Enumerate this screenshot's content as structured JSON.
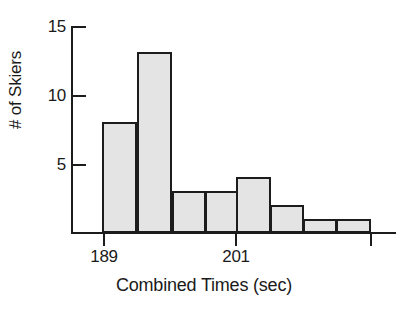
{
  "chart_data": {
    "type": "bar",
    "title": "",
    "xlabel": "Combined Times (sec)",
    "ylabel": "# of Skiers",
    "categories": [
      "189-190",
      "190-191",
      "191-192",
      "192-193",
      "201-202",
      "202-203",
      "203-204",
      "204-205"
    ],
    "values": [
      8,
      13,
      3,
      3,
      4,
      2,
      1,
      1
    ],
    "bar_count": 8,
    "ylim": [
      0,
      15.3
    ],
    "y_ticks": [
      5,
      10,
      15
    ],
    "y_tick_labels": [
      "5",
      "10",
      "15"
    ],
    "x_tick_labels": [
      "189",
      "201",
      ""
    ],
    "x_tick_positions": [
      0,
      4,
      8
    ],
    "grid": false,
    "legend": "none",
    "bar_fill_color": "#e4e4e4",
    "bar_edge_color": "#1c1c1c",
    "axis_color": "#1c1c1c"
  },
  "axes": {
    "y_ticks": [
      {
        "label": "15",
        "value": 15
      },
      {
        "label": "10",
        "value": 10
      },
      {
        "label": "5",
        "value": 5
      }
    ],
    "x_ticks": [
      {
        "label": "189",
        "bar_index": 0
      },
      {
        "label": "201",
        "bar_index": 4
      },
      {
        "label": "",
        "bar_index": 8
      }
    ],
    "x_axis_title": "Combined Times (sec)",
    "y_axis_title": "# of Skiers"
  },
  "bars": [
    {
      "value": 8,
      "label": "8"
    },
    {
      "value": 13,
      "label": "13"
    },
    {
      "value": 3,
      "label": "3"
    },
    {
      "value": 3,
      "label": "3"
    },
    {
      "value": 4,
      "label": "4"
    },
    {
      "value": 2,
      "label": "2"
    },
    {
      "value": 1,
      "label": "1"
    },
    {
      "value": 1,
      "label": "1"
    }
  ]
}
